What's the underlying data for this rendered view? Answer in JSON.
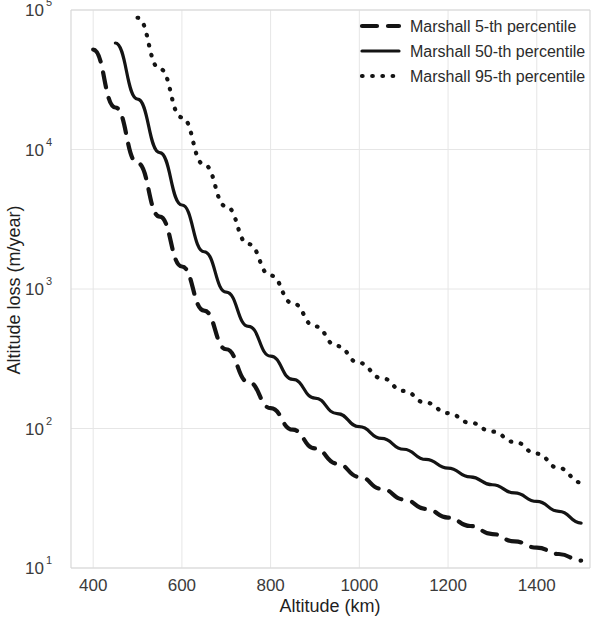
{
  "chart_data": {
    "type": "line",
    "title": "",
    "xlabel": "Altitude (km)",
    "ylabel": "Altitude loss (m/year)",
    "xlim": [
      350,
      1520
    ],
    "ylim": [
      10,
      100000
    ],
    "yscale": "log",
    "xscale": "linear",
    "grid": true,
    "legend_position": "top-right",
    "xticks": [
      400,
      600,
      800,
      1000,
      1200,
      1400
    ],
    "xtick_labels": [
      "400",
      "600",
      "800",
      "1000",
      "1200",
      "1400"
    ],
    "yticks": [
      10,
      100,
      1000,
      10000,
      100000
    ],
    "ytick_labels": [
      "10^1",
      "10^2",
      "10^3",
      "10^4",
      "10^5"
    ],
    "ytick_base": "10",
    "ytick_exponents": [
      "1",
      "2",
      "3",
      "4",
      "5"
    ],
    "series": [
      {
        "name": "Marshall 5-th percentile",
        "style": "dashed",
        "color": "#141414",
        "x": [
          400,
          450,
          500,
          550,
          600,
          650,
          700,
          750,
          800,
          850,
          900,
          950,
          1000,
          1050,
          1100,
          1150,
          1200,
          1250,
          1300,
          1350,
          1400,
          1450,
          1500
        ],
        "y": [
          52000,
          20000,
          8000,
          3300,
          1450,
          700,
          370,
          215,
          140,
          98,
          72,
          56,
          45,
          37,
          31,
          26.5,
          23,
          20,
          17.5,
          15.5,
          14,
          12.6,
          11.3
        ]
      },
      {
        "name": "Marshall 50-th percentile",
        "style": "solid",
        "color": "#141414",
        "x": [
          450,
          500,
          550,
          600,
          650,
          700,
          750,
          800,
          850,
          900,
          950,
          1000,
          1050,
          1100,
          1150,
          1200,
          1250,
          1300,
          1350,
          1400,
          1450,
          1500
        ],
        "y": [
          58000,
          23000,
          9500,
          4000,
          1850,
          950,
          540,
          330,
          225,
          165,
          128,
          103,
          85,
          71,
          60,
          52,
          45,
          39.5,
          34.5,
          30,
          25.5,
          21
        ]
      },
      {
        "name": "Marshall 95-th percentile",
        "style": "dotted",
        "color": "#141414",
        "x": [
          500,
          550,
          600,
          650,
          700,
          750,
          800,
          850,
          900,
          950,
          1000,
          1050,
          1100,
          1150,
          1200,
          1250,
          1300,
          1350,
          1400,
          1450,
          1500
        ],
        "y": [
          88000,
          38000,
          17000,
          7800,
          3900,
          2100,
          1250,
          790,
          540,
          390,
          295,
          230,
          186,
          153,
          129,
          110,
          95,
          80,
          66,
          52,
          41
        ]
      }
    ]
  },
  "axes": {
    "x_title": "Altitude (km)",
    "y_title": "Altitude loss (m/year)"
  },
  "legend": {
    "items": [
      {
        "label": "Marshall 5-th percentile",
        "style": "dashed"
      },
      {
        "label": "Marshall 50-th percentile",
        "style": "solid"
      },
      {
        "label": "Marshall 95-th percentile",
        "style": "dotted"
      }
    ]
  }
}
